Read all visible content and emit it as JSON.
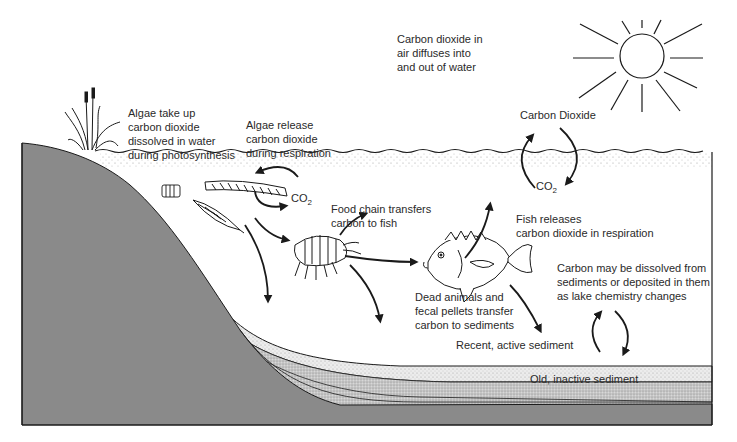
{
  "diagram": {
    "colors": {
      "bank": "#8a8a8a",
      "recent_sediment": "#e6e6e6",
      "old_sediment": "#c4c4c4",
      "bedrock": "#8a8a8a",
      "ink": "#1a1a1a",
      "water": "#ffffff"
    },
    "labels": {
      "air_diffusion": "Carbon dioxide in\nair diffuses into\nand out of water",
      "algae_uptake": "Algae take up\ncarbon dioxide\ndissolved in water\nduring photosynthesis",
      "algae_release": "Algae release\ncarbon dioxide\nduring respiration",
      "carbon_dioxide_air": "Carbon Dioxide",
      "co2_water": "CO",
      "co2_water_sub": "2",
      "co2_algae": "CO",
      "co2_algae_sub": "2",
      "food_chain": "Food chain transfers\ncarbon to fish",
      "fish_releases": "Fish releases\ncarbon dioxide in respiration",
      "dead_animals": "Dead animals and\nfecal pellets transfer\ncarbon to sediments",
      "carbon_sediment_exchange": "Carbon may be dissolved from\nsediments or deposited in them\nas lake chemistry changes",
      "recent_sediment": "Recent, active sediment",
      "old_sediment": "Old, inactive sediment"
    },
    "icons": {
      "sun": "sun-icon",
      "reeds": "reed-plant-icon",
      "algae_filament": "algae-filament-icon",
      "diatom": "diatom-icon",
      "colonial_algae": "colonial-algae-icon",
      "shrimp": "zooplankton-shrimp-icon",
      "fish": "fish-icon"
    }
  }
}
